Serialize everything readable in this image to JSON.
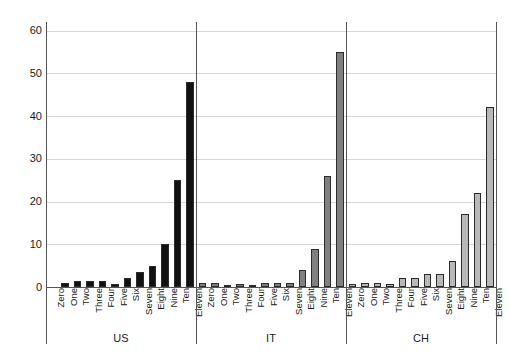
{
  "chart_data": {
    "type": "bar",
    "title": "",
    "xlabel": "",
    "ylabel": "",
    "ylim": [
      0,
      62
    ],
    "yticks": [
      0,
      10,
      20,
      30,
      40,
      50,
      60
    ],
    "grid": true,
    "legend": "none",
    "categories": [
      "Zero",
      "One",
      "Two",
      "Three",
      "Four",
      "Five",
      "Six",
      "Seven",
      "Eight",
      "Nine",
      "Ten",
      "Eleven"
    ],
    "groups": [
      {
        "name": "US",
        "color": "#111111",
        "values": [
          0,
          1,
          1.5,
          1.5,
          1.5,
          0.8,
          2,
          3.5,
          5,
          10,
          25,
          48
        ]
      },
      {
        "name": "IT",
        "color": "#808080",
        "values": [
          1,
          1,
          0.5,
          0.8,
          0.5,
          1,
          1,
          1,
          4,
          9,
          26,
          55
        ]
      },
      {
        "name": "CH",
        "color": "#b8b8b8",
        "values": [
          0.8,
          1,
          1,
          0.8,
          2,
          2,
          3,
          3,
          6,
          17,
          22,
          42
        ]
      }
    ]
  },
  "axes": {
    "y_tick_labels": [
      "0",
      "10",
      "20",
      "30",
      "40",
      "50",
      "60"
    ],
    "bar_outline_color": "#2b2b2b",
    "gridline_color": "#d8d8d8",
    "axis_color": "#555555",
    "background": "#ffffff"
  }
}
